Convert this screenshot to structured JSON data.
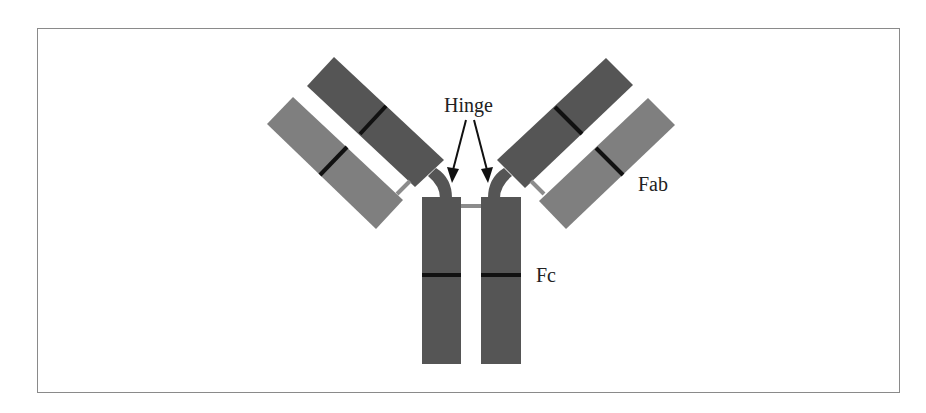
{
  "diagram": {
    "labels": {
      "hinge": "Hinge",
      "fab": "Fab",
      "fc": "Fc"
    },
    "colors": {
      "heavy_chain": "#555555",
      "light_chain": "#7f7f7f",
      "domain_divider": "#111111",
      "disulfide_bridge": "#8c8c8c",
      "frame_border": "#8a8a8a",
      "text": "#222222"
    },
    "components": [
      {
        "id": "left-heavy-arm",
        "type": "heavy chain (Fab region)"
      },
      {
        "id": "left-light-chain",
        "type": "light chain"
      },
      {
        "id": "right-heavy-arm",
        "type": "heavy chain (Fab region)"
      },
      {
        "id": "right-light-chain",
        "type": "light chain"
      },
      {
        "id": "fc-left",
        "type": "heavy chain (Fc region)"
      },
      {
        "id": "fc-right",
        "type": "heavy chain (Fc region)"
      }
    ]
  }
}
